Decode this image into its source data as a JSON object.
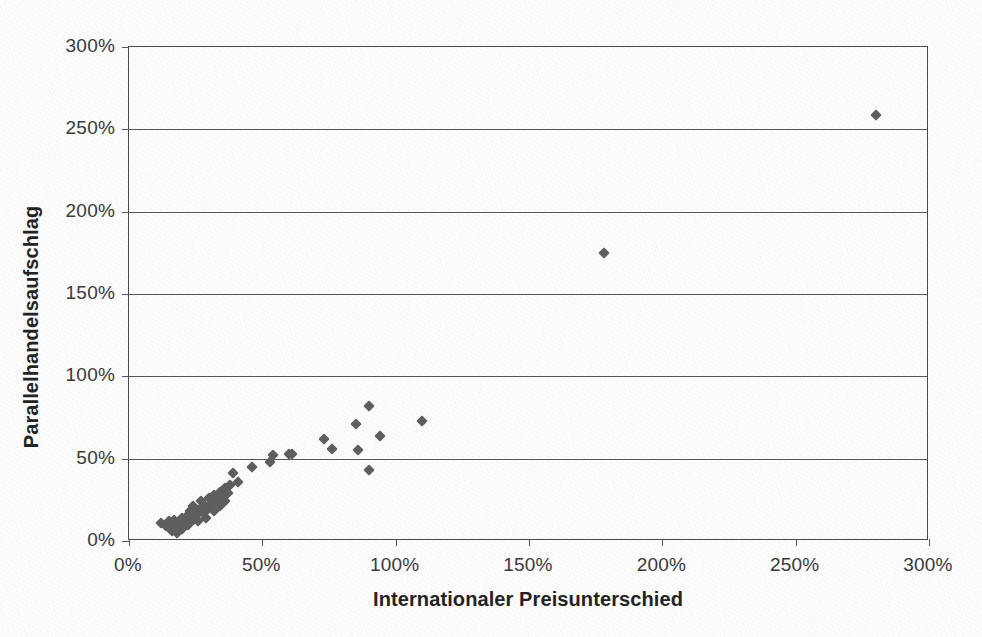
{
  "chart_data": {
    "type": "scatter",
    "title": "",
    "xlabel": "Internationaler Preisunterschied",
    "ylabel": "Parallelhandelsaufschlag",
    "xlim": [
      0,
      300
    ],
    "ylim": [
      0,
      300
    ],
    "grid": "horizontal",
    "legend": "none",
    "unit": "%",
    "xticks": [
      "0%",
      "50%",
      "100%",
      "150%",
      "200%",
      "250%",
      "300%"
    ],
    "yticks": [
      "0%",
      "50%",
      "100%",
      "150%",
      "200%",
      "250%",
      "300%"
    ],
    "xtick_values": [
      0,
      50,
      100,
      150,
      200,
      250,
      300
    ],
    "ytick_values": [
      0,
      50,
      100,
      150,
      200,
      250,
      300
    ],
    "marker": "diamond",
    "marker_color": "#5e5e5e",
    "series": [
      {
        "name": "Beobachtungen",
        "points": [
          [
            12,
            11
          ],
          [
            14,
            9
          ],
          [
            15,
            12
          ],
          [
            16,
            6
          ],
          [
            16,
            10
          ],
          [
            17,
            8
          ],
          [
            17,
            13
          ],
          [
            18,
            5
          ],
          [
            18,
            11
          ],
          [
            19,
            9
          ],
          [
            20,
            14
          ],
          [
            20,
            7
          ],
          [
            21,
            12
          ],
          [
            22,
            16
          ],
          [
            22,
            10
          ],
          [
            23,
            18
          ],
          [
            24,
            13
          ],
          [
            24,
            21
          ],
          [
            25,
            15
          ],
          [
            26,
            19
          ],
          [
            26,
            12
          ],
          [
            27,
            24
          ],
          [
            28,
            17
          ],
          [
            28,
            22
          ],
          [
            29,
            14
          ],
          [
            30,
            26
          ],
          [
            30,
            20
          ],
          [
            31,
            23
          ],
          [
            32,
            28
          ],
          [
            32,
            18
          ],
          [
            33,
            25
          ],
          [
            34,
            30
          ],
          [
            34,
            21
          ],
          [
            35,
            27
          ],
          [
            36,
            32
          ],
          [
            36,
            24
          ],
          [
            37,
            29
          ],
          [
            38,
            34
          ],
          [
            39,
            41
          ],
          [
            41,
            36
          ],
          [
            46,
            45
          ],
          [
            53,
            48
          ],
          [
            54,
            52
          ],
          [
            60,
            53
          ],
          [
            61,
            53
          ],
          [
            73,
            62
          ],
          [
            76,
            56
          ],
          [
            85,
            71
          ],
          [
            86,
            55
          ],
          [
            90,
            82
          ],
          [
            90,
            43
          ],
          [
            94,
            64
          ],
          [
            110,
            73
          ],
          [
            178,
            175
          ],
          [
            280,
            259
          ]
        ]
      }
    ]
  },
  "axes": {
    "x_axis_name": "Internationaler Preisunterschied",
    "y_axis_name": "Parallelhandelsaufschlag"
  }
}
